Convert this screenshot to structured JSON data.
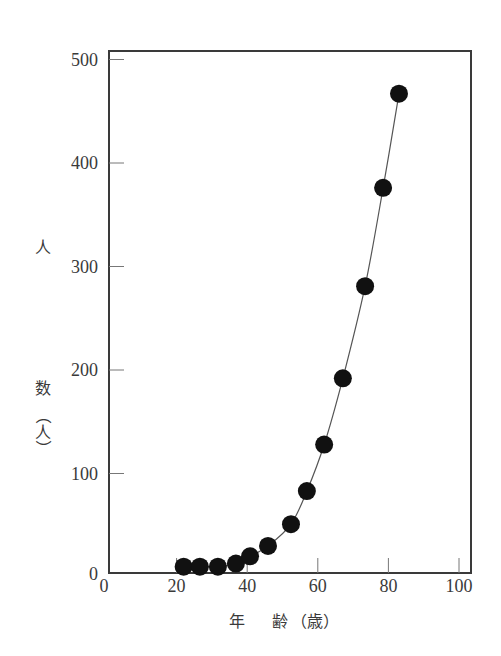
{
  "chart_data": {
    "type": "line",
    "title": "",
    "xlabel": "年 齢（歳）",
    "ylabel": "人数（人）",
    "ylabel_chars": [
      "人",
      "数",
      "（",
      "人",
      "）"
    ],
    "xlabel_parts": [
      "年",
      "齢",
      "（歳）"
    ],
    "xlim": [
      -1,
      102.5
    ],
    "ylim": [
      -5,
      510
    ],
    "xticks": [
      0,
      20,
      40,
      60,
      80,
      100
    ],
    "yticks": [
      0,
      100,
      200,
      300,
      400,
      500
    ],
    "xtick_labels": [
      "0",
      "20",
      "40",
      "60",
      "80",
      "100"
    ],
    "ytick_labels": [
      "0",
      "100",
      "200",
      "300",
      "400",
      "500"
    ],
    "grid": false,
    "legend": "none",
    "markers": "filled-circle",
    "line_color": "#555555",
    "marker_color": "#111111",
    "series": [
      {
        "name": "人数",
        "x": [
          22,
          26.6,
          31.7,
          36.8,
          40.8,
          45.9,
          52.4,
          56.9,
          61.8,
          67.1,
          73.4,
          78.5,
          83.0
        ],
        "y": [
          10,
          10,
          10,
          13,
          20,
          30,
          51,
          83,
          128,
          192,
          281,
          376,
          467
        ]
      }
    ]
  }
}
